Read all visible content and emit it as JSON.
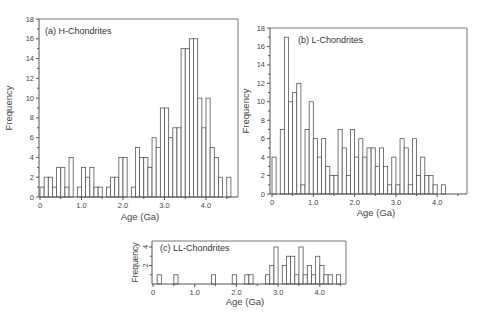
{
  "chart_data": [
    {
      "id": "a",
      "type": "bar",
      "title": "(a) H-Chondrites",
      "xlabel": "Age (Ga)",
      "ylabel": "Frequency",
      "bin_width": 0.1,
      "xlim": [
        0,
        4.7
      ],
      "ylim": [
        0,
        18
      ],
      "x_ticks": [
        "0",
        "1.0",
        "2.0",
        "3.0",
        "4.0"
      ],
      "y_ticks": [
        "0",
        "2",
        "4",
        "6",
        "8",
        "10",
        "12",
        "14",
        "16",
        "18"
      ],
      "grid": false,
      "bin_starts": [
        0.0,
        0.1,
        0.2,
        0.3,
        0.4,
        0.5,
        0.6,
        0.7,
        0.8,
        0.9,
        1.0,
        1.1,
        1.2,
        1.3,
        1.4,
        1.5,
        1.6,
        1.7,
        1.8,
        1.9,
        2.0,
        2.1,
        2.2,
        2.3,
        2.4,
        2.5,
        2.6,
        2.7,
        2.8,
        2.9,
        3.0,
        3.1,
        3.2,
        3.3,
        3.4,
        3.5,
        3.6,
        3.7,
        3.8,
        3.9,
        4.0,
        4.1,
        4.2,
        4.3,
        4.4,
        4.5
      ],
      "values": [
        1,
        2,
        2,
        1,
        3,
        3,
        1,
        4,
        0,
        1,
        3,
        2,
        3,
        1,
        1,
        0,
        1,
        2,
        2,
        4,
        4,
        0,
        1,
        5,
        4,
        4,
        3,
        6,
        5,
        9,
        9,
        6,
        7,
        7,
        15,
        15,
        16,
        16,
        10,
        7,
        10,
        5,
        4,
        2,
        0,
        2
      ]
    },
    {
      "id": "b",
      "type": "bar",
      "title": "(b) L-Chondrites",
      "xlabel": "Age (Ga)",
      "ylabel": "Frequency",
      "bin_width": 0.1,
      "xlim": [
        0,
        4.7
      ],
      "ylim": [
        0,
        18
      ],
      "x_ticks": [
        "0",
        "1.0",
        "2.0",
        "3.0",
        "4.0"
      ],
      "y_ticks": [
        "0",
        "2",
        "4",
        "6",
        "8",
        "10",
        "12",
        "14",
        "16",
        "18"
      ],
      "grid": false,
      "bin_starts": [
        0.0,
        0.1,
        0.2,
        0.3,
        0.4,
        0.5,
        0.6,
        0.7,
        0.8,
        0.9,
        1.0,
        1.1,
        1.2,
        1.3,
        1.4,
        1.5,
        1.6,
        1.7,
        1.8,
        1.9,
        2.0,
        2.1,
        2.2,
        2.3,
        2.4,
        2.5,
        2.6,
        2.7,
        2.8,
        2.9,
        3.0,
        3.1,
        3.2,
        3.3,
        3.4,
        3.5,
        3.6,
        3.7,
        3.8,
        3.9,
        4.0,
        4.1
      ],
      "values": [
        4,
        0,
        7,
        17,
        10,
        11,
        12,
        1,
        7,
        10,
        6,
        4,
        6,
        3,
        2,
        2,
        7,
        5,
        2,
        7,
        4,
        6,
        4,
        5,
        5,
        3,
        5,
        3,
        1,
        4,
        1,
        6,
        5,
        1,
        6,
        2,
        4,
        2,
        2,
        1,
        0,
        1
      ]
    },
    {
      "id": "c",
      "type": "bar",
      "title": "(c) LL-Chondrites",
      "xlabel": "Age (Ga)",
      "ylabel": "Frequency",
      "bin_width": 0.1,
      "xlim": [
        0,
        4.6
      ],
      "ylim": [
        0,
        4.5
      ],
      "x_ticks": [
        "0",
        "1.0",
        "2.0",
        "3.0",
        "4.0"
      ],
      "y_ticks": [
        "2",
        "4"
      ],
      "grid": false,
      "bin_starts": [
        0.1,
        0.5,
        1.4,
        1.9,
        2.2,
        2.3,
        2.7,
        2.8,
        2.9,
        3.1,
        3.2,
        3.3,
        3.4,
        3.5,
        3.6,
        3.7,
        3.8,
        3.9,
        4.0,
        4.1,
        4.2,
        4.4
      ],
      "values": [
        1,
        1,
        1,
        1,
        1,
        1,
        1,
        2,
        4,
        2,
        3,
        3,
        1,
        4,
        1,
        2,
        1,
        3,
        2,
        1,
        1,
        1
      ]
    }
  ]
}
